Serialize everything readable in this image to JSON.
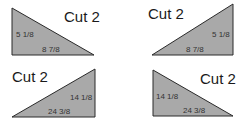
{
  "colors": {
    "triangle_fill": "#a9a9a9",
    "triangle_stroke": "#2a2a2a",
    "label_text": "#1a1a1a",
    "dimension_text": "#333333",
    "background": "#ffffff"
  },
  "pieces": [
    {
      "title": "Cut 2",
      "orientation": "right-angle-bottom-left",
      "short_side": "5 1/8",
      "long_side": "8 7/8"
    },
    {
      "title": "Cut 2",
      "orientation": "right-angle-bottom-right",
      "short_side": "5 1/8",
      "long_side": "8 7/8"
    },
    {
      "title": "Cut 2",
      "orientation": "right-angle-bottom-right",
      "short_side": "14 1/8",
      "long_side": "24 3/8"
    },
    {
      "title": "Cut 2",
      "orientation": "right-angle-bottom-left",
      "short_side": "14 1/8",
      "long_side": "24 3/8"
    }
  ]
}
